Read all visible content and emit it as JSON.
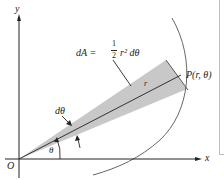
{
  "diagram": {
    "labels": {
      "y_axis": "y",
      "x_axis": "x",
      "origin": "O",
      "formula_lhs": "dA =",
      "formula_frac_num": "1",
      "formula_frac_den": "2",
      "formula_rhs": "r² dθ",
      "point": "P(r, θ)",
      "radius": "r",
      "dtheta": "dθ",
      "theta": "θ"
    },
    "colors": {
      "ink": "#222222",
      "wedge_fill": "#c8c8c8",
      "curve": "#555555",
      "frame": "#bdbdbd"
    }
  }
}
